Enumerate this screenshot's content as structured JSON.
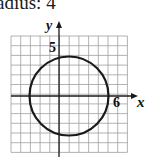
{
  "caption": "adius: 4",
  "graph": {
    "y_axis_label": "y",
    "x_axis_label": "x",
    "y_tick_label": "5",
    "x_tick_label": "6",
    "grid": {
      "left": 11,
      "top": 36,
      "cols": 12,
      "rows": 12,
      "cell": 9.7
    },
    "circle": {
      "cx": 69,
      "cy": 96,
      "r": 39.5
    },
    "colors": {
      "grid": "#9a9a9a",
      "axis": "#1a1a1a",
      "circle": "#1a1a1a"
    }
  }
}
